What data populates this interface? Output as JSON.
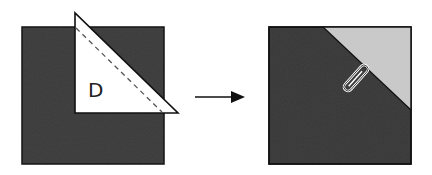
{
  "diagram": {
    "type": "folding-step-illustration",
    "steps": [
      {
        "name": "before",
        "description": "Dark square with white triangular corner flap folded up along dashed line",
        "flap_label": "D",
        "colors": {
          "square": "#3a3a3a",
          "flap": "#ffffff",
          "outline": "#111111",
          "dashed_line": "#555555"
        }
      },
      {
        "name": "after",
        "description": "Dark square with light gray top-right triangle held by a paper clip",
        "colors": {
          "square": "#3a3a3a",
          "corner": "#c9c9c9",
          "outline": "#111111",
          "clip": "#ffffff"
        }
      }
    ],
    "arrow": {
      "direction": "right",
      "color": "#111111"
    }
  }
}
